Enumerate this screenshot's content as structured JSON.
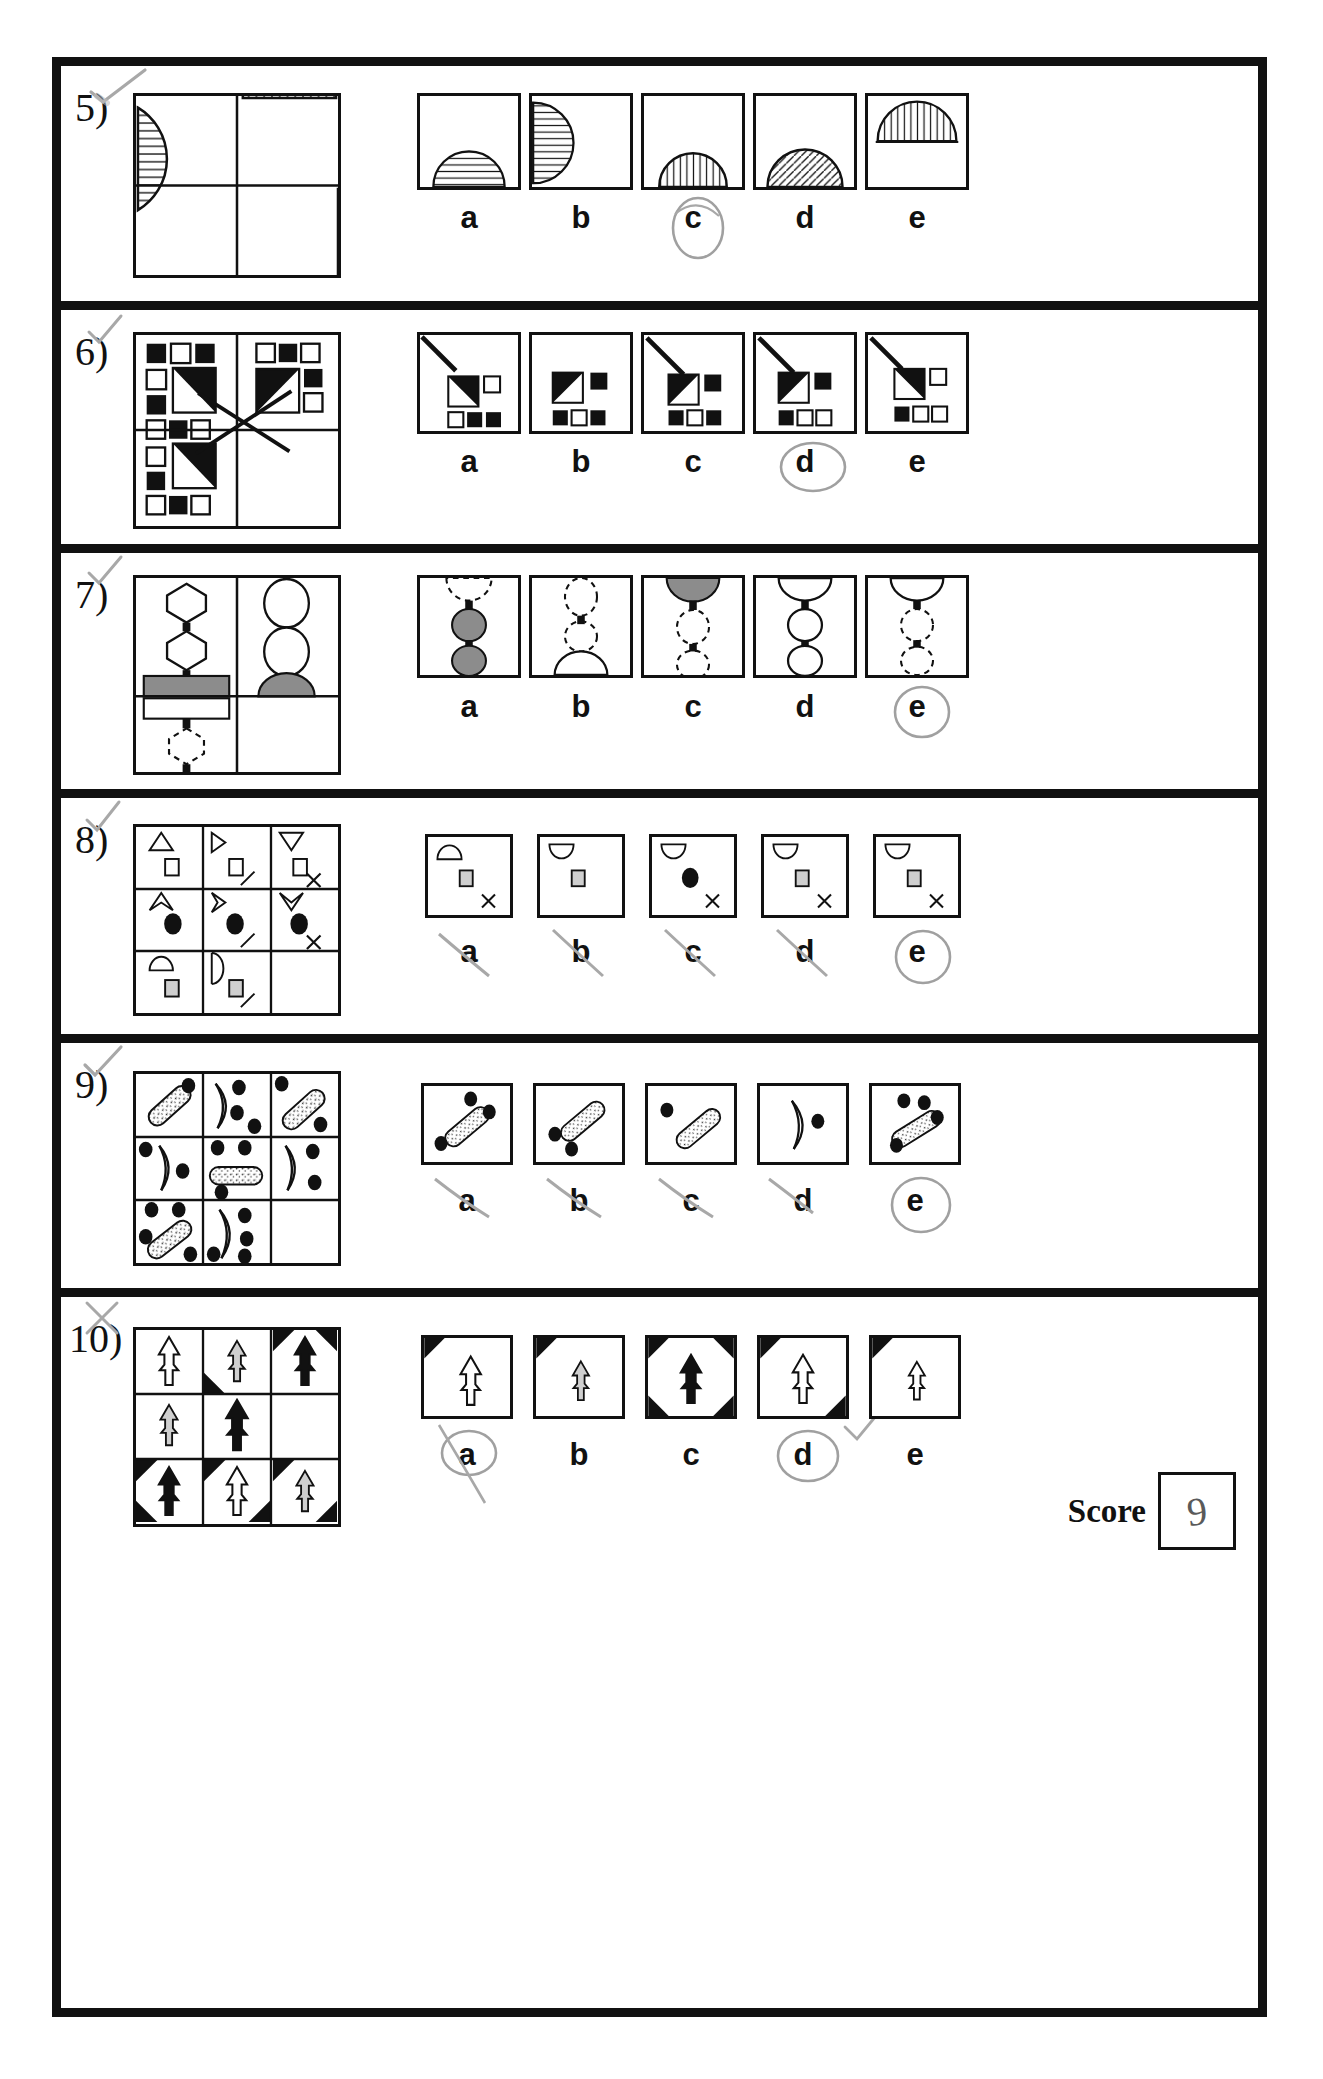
{
  "sheet": {
    "title": "Non-verbal reasoning test answer sheet",
    "score_label": "Score",
    "score_value": "9",
    "ink_color": "#111111",
    "pencil_color": "#9a9a9a",
    "shade_gray": "#8c8c8c",
    "light_gray": "#cfcfcf"
  },
  "option_letters": [
    "a",
    "b",
    "c",
    "d",
    "e"
  ],
  "questions": [
    {
      "number": "5)",
      "matrix_rows": 2,
      "matrix_cols": 2,
      "description": "Semi-circles with hatching inside a 2x2 grid; bottom-right cell blank",
      "matrix_cells": [
        {
          "shape": "half-circle-right",
          "hatch": "horizontal"
        },
        {
          "shape": "half-circle-bottom",
          "hatch": "vertical"
        },
        {
          "shape": "empty",
          "hatch": "none"
        },
        {
          "shape": "half-circle-right",
          "hatch": "horizontal"
        }
      ],
      "options": [
        {
          "label": "a",
          "shape": "half-circle-bottom",
          "hatch": "horizontal",
          "selected": false
        },
        {
          "label": "b",
          "shape": "half-circle-left",
          "hatch": "horizontal",
          "selected": false
        },
        {
          "label": "c",
          "shape": "half-circle-bottom",
          "hatch": "vertical",
          "selected": true
        },
        {
          "label": "d",
          "shape": "half-circle-bottom",
          "hatch": "diagonal",
          "selected": false
        },
        {
          "label": "e",
          "shape": "half-circle-top",
          "hatch": "vertical",
          "selected": false
        }
      ],
      "answer": "c",
      "marked_correct": true
    },
    {
      "number": "6)",
      "matrix_rows": 2,
      "matrix_cols": 2,
      "description": "Clusters of small black and white squares with a half-black square and a long diagonal line; bottom-right cell blank",
      "options": [
        {
          "label": "a",
          "selected": false
        },
        {
          "label": "b",
          "selected": false
        },
        {
          "label": "c",
          "selected": false
        },
        {
          "label": "d",
          "selected": true
        },
        {
          "label": "e",
          "selected": false
        }
      ],
      "answer": "d",
      "marked_correct": true
    },
    {
      "number": "7)",
      "matrix_rows": 2,
      "matrix_cols": 2,
      "description": "Chains of hexagons, circles, bars and dashed shapes; bottom-right cell blank",
      "options": [
        {
          "label": "a",
          "selected": false
        },
        {
          "label": "b",
          "selected": false
        },
        {
          "label": "c",
          "selected": false
        },
        {
          "label": "d",
          "selected": false
        },
        {
          "label": "e",
          "selected": true
        }
      ],
      "answer": "e",
      "marked_correct": true
    },
    {
      "number": "8)",
      "matrix_rows": 3,
      "matrix_cols": 3,
      "description": "Arrow-head outlines with square or oval marker and slash or cross; bottom-right cell blank",
      "options": [
        {
          "label": "a",
          "selected": false,
          "struck": true
        },
        {
          "label": "b",
          "selected": false,
          "struck": true
        },
        {
          "label": "c",
          "selected": false,
          "struck": true
        },
        {
          "label": "d",
          "selected": false,
          "struck": true
        },
        {
          "label": "e",
          "selected": true,
          "struck": false
        }
      ],
      "answer": "e",
      "marked_correct": true
    },
    {
      "number": "9)",
      "matrix_rows": 3,
      "matrix_cols": 3,
      "description": "Speckled capsules or crescents with black dots; bottom-right cell blank",
      "options": [
        {
          "label": "a",
          "selected": false,
          "struck": true
        },
        {
          "label": "b",
          "selected": false,
          "struck": true
        },
        {
          "label": "c",
          "selected": false,
          "struck": true
        },
        {
          "label": "d",
          "selected": false,
          "struck": true
        },
        {
          "label": "e",
          "selected": true,
          "struck": false
        }
      ],
      "answer": "e",
      "marked_correct": true
    },
    {
      "number": "10)",
      "matrix_rows": 3,
      "matrix_cols": 3,
      "description": "Upward arrows (white, gray, black) with black corner wedges; bottom-right cell filled",
      "options": [
        {
          "label": "a",
          "selected": true,
          "struck": true
        },
        {
          "label": "b",
          "selected": false,
          "struck": false
        },
        {
          "label": "c",
          "selected": false,
          "struck": false
        },
        {
          "label": "d",
          "selected": true,
          "struck": false
        },
        {
          "label": "e",
          "selected": false,
          "struck": false
        }
      ],
      "answer": "d",
      "marked_correct": false
    }
  ]
}
